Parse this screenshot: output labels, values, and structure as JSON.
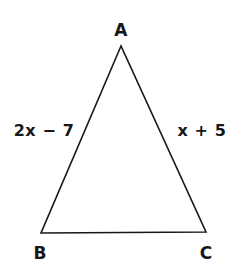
{
  "figure": {
    "type": "geometry-diagram",
    "shape": "triangle",
    "background_color": "#ffffff",
    "stroke_color": "#171717",
    "text_color": "#171717",
    "stroke_width": 1.6,
    "vertices": [
      {
        "name": "A",
        "label": "A",
        "x": 121,
        "y": 46,
        "label_x": 121,
        "label_y": 30
      },
      {
        "name": "B",
        "label": "B",
        "x": 41,
        "y": 233,
        "label_x": 40,
        "label_y": 253
      },
      {
        "name": "C",
        "label": "C",
        "x": 206,
        "y": 232,
        "label_x": 206,
        "label_y": 253
      }
    ],
    "side_labels": [
      {
        "side": "AB",
        "text": "2x − 7",
        "x": 44,
        "y": 131
      },
      {
        "side": "AC",
        "text": "x + 5",
        "x": 202,
        "y": 131
      }
    ]
  }
}
